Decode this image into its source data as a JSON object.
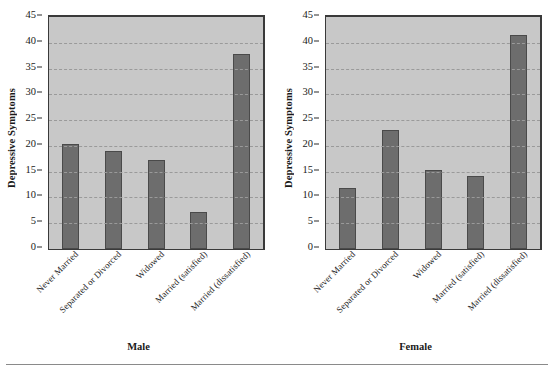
{
  "figure": {
    "background": "#ffffff",
    "plot_background": "#c8c8c8",
    "bar_color": "#6d6d6d",
    "grid_color": "#9a9a9a",
    "axis_color": "#3a3a3a"
  },
  "panels": [
    {
      "name": "male",
      "group_title": "Male",
      "ylabel": "Depressive Symptoms"
    },
    {
      "name": "female",
      "group_title": "Female",
      "ylabel": "Depressive Symptoms"
    }
  ],
  "axis": {
    "ticks": [
      "45",
      "40",
      "35",
      "30",
      "25",
      "20",
      "15",
      "10",
      "5",
      "0"
    ],
    "min": 0,
    "max": 45,
    "step": 5
  },
  "categories": [
    "Never Married",
    "Separated or Divorced",
    "Widowed",
    "Married (satisfied)",
    "Married (dissatisfied)"
  ],
  "chart_data": {
    "type": "bar",
    "title": "",
    "subtitle": "",
    "xlabel": "",
    "ylabel": "Depressive Symptoms",
    "ylim": [
      0,
      45
    ],
    "ytick_step": 5,
    "grid": true,
    "grid_style": "dashed horizontal",
    "legend": "none",
    "panel_layout": "two side-by-side panels sharing the same y axis",
    "categories": [
      "Never Married",
      "Separated or Divorced",
      "Widowed",
      "Married (satisfied)",
      "Married (dissatisfied)"
    ],
    "panels": [
      {
        "name": "Male",
        "values": [
          20.4,
          19.1,
          17.2,
          7.1,
          37.9
        ]
      },
      {
        "name": "Female",
        "values": [
          11.9,
          23.0,
          15.3,
          14.2,
          41.5
        ]
      }
    ],
    "series": [
      {
        "name": "Male",
        "values": [
          20.4,
          19.1,
          17.2,
          7.1,
          37.9
        ]
      },
      {
        "name": "Female",
        "values": [
          11.9,
          23.0,
          15.3,
          14.2,
          41.5
        ]
      }
    ]
  }
}
